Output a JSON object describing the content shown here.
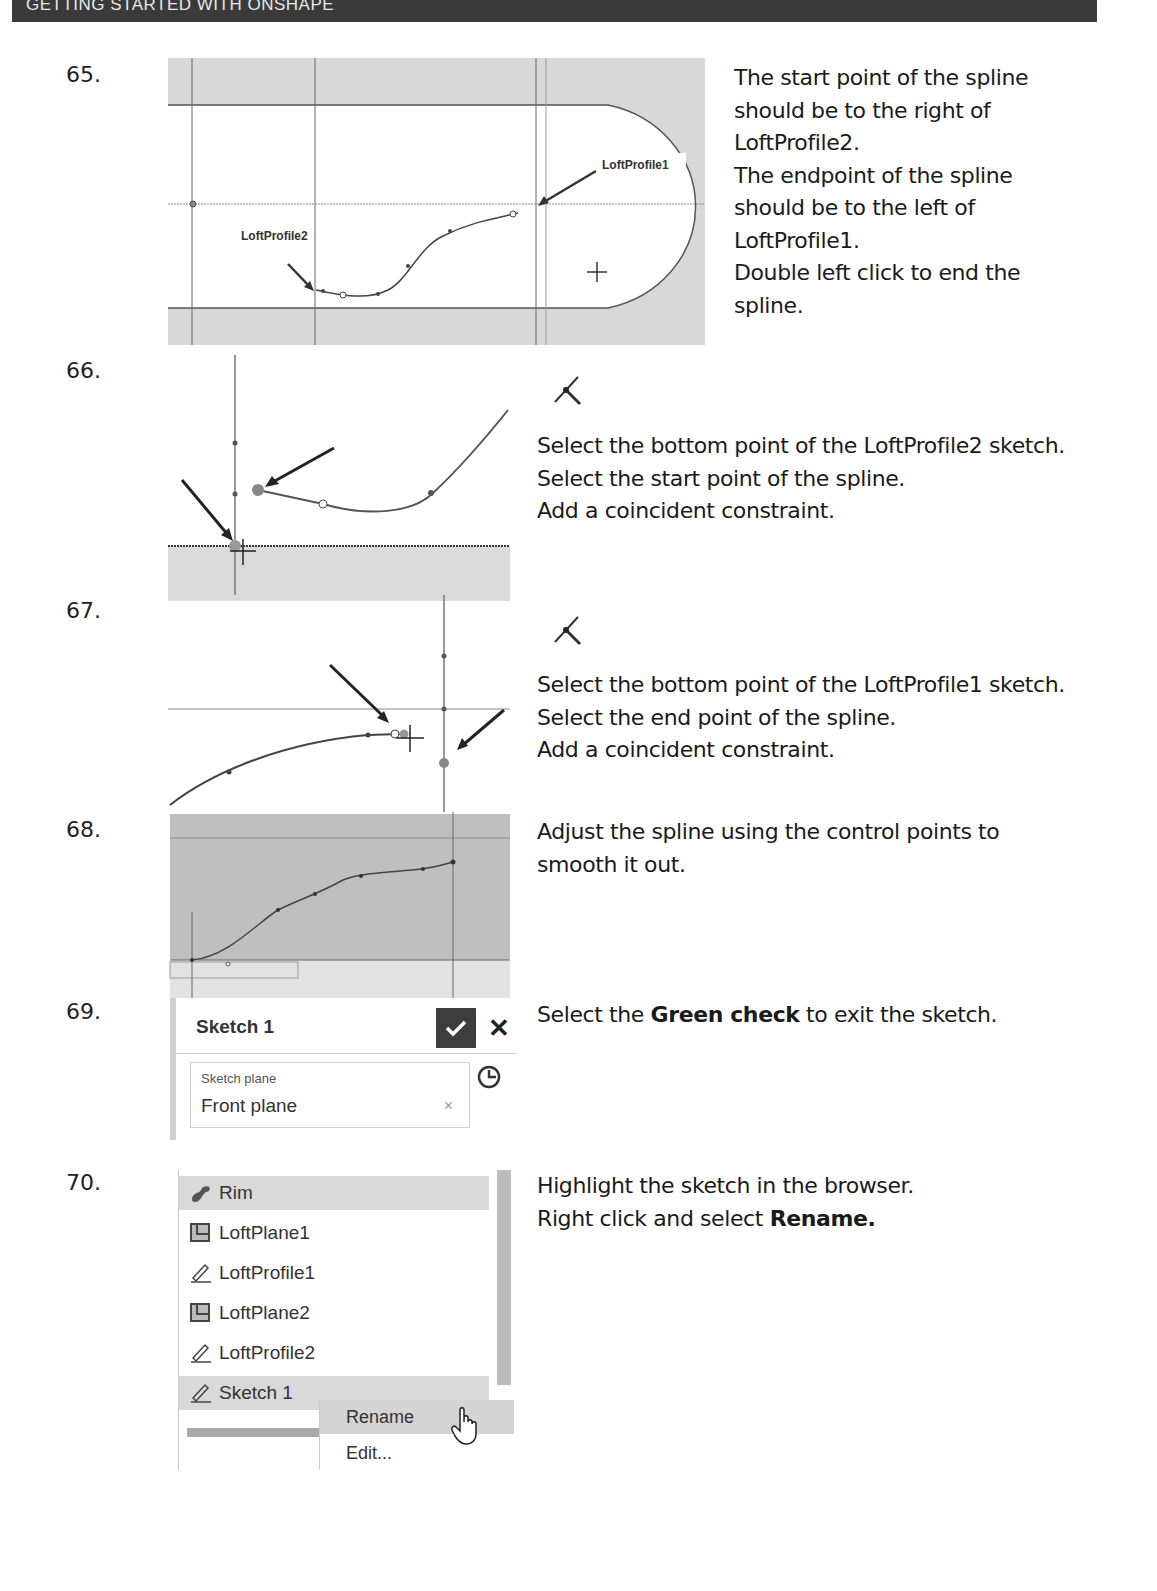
{
  "header": {
    "title": "GETTING STARTED WITH ONSHAPE"
  },
  "steps": [
    {
      "number": "65.",
      "lines": [
        "The start point of the spline",
        "should be to the right of",
        "LoftProfile2.",
        "The endpoint of the spline",
        "should be to the left of",
        "LoftProfile1.",
        "Double left click to end the",
        "spline."
      ],
      "figure": {
        "labels": [
          "LoftProfile1",
          "LoftProfile2"
        ]
      }
    },
    {
      "number": "66.",
      "icon": "coincident-constraint-icon",
      "lines": [
        "Select the bottom point of the LoftProfile2 sketch.",
        "Select the start point of the spline.",
        "Add a coincident constraint."
      ]
    },
    {
      "number": "67.",
      "icon": "coincident-constraint-icon",
      "lines": [
        "Select the bottom point of the LoftProfile1 sketch.",
        "Select the end point of the spline.",
        "Add a coincident constraint."
      ]
    },
    {
      "number": "68.",
      "lines": [
        "Adjust the spline using the control points to",
        "smooth it out."
      ]
    },
    {
      "number": "69.",
      "text_pre": "Select the ",
      "text_bold": "Green check",
      "text_post": " to exit the sketch.",
      "panel": {
        "title": "Sketch 1",
        "field_label": "Sketch plane",
        "field_value": "Front plane",
        "clear_glyph": "×",
        "close_glyph": "✕"
      }
    },
    {
      "number": "70.",
      "line1": "Highlight the sketch in the browser.",
      "line2_pre": "Right click and select ",
      "line2_bold": "Rename.",
      "browser": {
        "items": [
          {
            "label": "Rim",
            "icon": "part-icon"
          },
          {
            "label": "LoftPlane1",
            "icon": "plane-icon"
          },
          {
            "label": "LoftProfile1",
            "icon": "sketch-icon"
          },
          {
            "label": "LoftPlane2",
            "icon": "plane-icon"
          },
          {
            "label": "LoftProfile2",
            "icon": "sketch-icon"
          },
          {
            "label": "Sketch 1",
            "icon": "sketch-icon"
          }
        ],
        "context_menu": [
          "Rename",
          "Edit..."
        ]
      }
    }
  ],
  "colors": {
    "header_bg": "#3a3a3a",
    "check_bg": "#3d3d3d",
    "highlight": "#d9d9d9",
    "region_gray": "#d6d6d6"
  }
}
